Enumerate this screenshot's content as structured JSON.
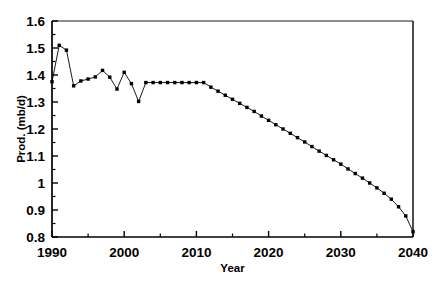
{
  "chart_data": {
    "type": "line",
    "title": "",
    "subtitle": "",
    "xlabel": "Year",
    "ylabel": "Prod. (mb/d)",
    "xlim": [
      1990,
      2040
    ],
    "ylim": [
      0.8,
      1.6
    ],
    "x_major_ticks": [
      1990,
      2000,
      2010,
      2020,
      2030,
      2040
    ],
    "x_major_tick_labels": [
      "1990",
      "2000",
      "2010",
      "2020",
      "2030",
      "2040"
    ],
    "x_minor_ticks": [
      1995,
      2005,
      2015,
      2025,
      2035
    ],
    "y_major_ticks": [
      0.8,
      0.9,
      1.0,
      1.1,
      1.2,
      1.3,
      1.4,
      1.5,
      1.6
    ],
    "y_major_tick_labels": [
      "0.8",
      "0.9",
      "1",
      "1.1",
      "1.2",
      "1.3",
      "1.4",
      "1.5",
      "1.6"
    ],
    "y_minor_ticks": [
      0.85,
      0.95,
      1.05,
      1.15,
      1.25,
      1.35,
      1.45,
      1.55
    ],
    "grid": false,
    "legend": null,
    "annotations": [],
    "line_color": "#000000",
    "marker": "square",
    "marker_color": "#000000",
    "x": [
      1990,
      1991,
      1992,
      1993,
      1994,
      1995,
      1996,
      1997,
      1998,
      1999,
      2000,
      2001,
      2002,
      2003,
      2004,
      2005,
      2006,
      2007,
      2008,
      2009,
      2010,
      2011,
      2012,
      2013,
      2014,
      2015,
      2016,
      2017,
      2018,
      2019,
      2020,
      2021,
      2022,
      2023,
      2024,
      2025,
      2026,
      2027,
      2028,
      2029,
      2030,
      2031,
      2032,
      2033,
      2034,
      2035,
      2036,
      2037,
      2038,
      2039,
      2040
    ],
    "y": [
      1.375,
      1.51,
      1.492,
      1.36,
      1.378,
      1.385,
      1.393,
      1.417,
      1.392,
      1.348,
      1.41,
      1.368,
      1.302,
      1.372,
      1.372,
      1.372,
      1.372,
      1.372,
      1.372,
      1.372,
      1.372,
      1.372,
      1.355,
      1.34,
      1.325,
      1.31,
      1.295,
      1.28,
      1.265,
      1.248,
      1.232,
      1.216,
      1.2,
      1.184,
      1.168,
      1.152,
      1.135,
      1.118,
      1.102,
      1.086,
      1.07,
      1.052,
      1.035,
      1.018,
      1.0,
      0.982,
      0.962,
      0.94,
      0.912,
      0.878,
      0.82
    ]
  }
}
